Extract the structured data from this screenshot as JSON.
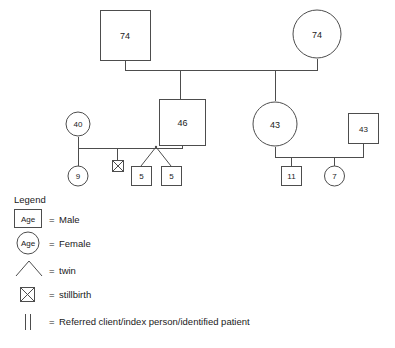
{
  "diagram": {
    "type": "genogram",
    "generations": [
      {
        "name": "grandparents",
        "members": [
          {
            "id": "g1-male",
            "shape": "square",
            "sex": "male",
            "age": "74"
          },
          {
            "id": "g1-female",
            "shape": "circle",
            "sex": "female",
            "age": "74"
          }
        ]
      },
      {
        "name": "parents",
        "members": [
          {
            "id": "g2-female-partner",
            "shape": "circle",
            "sex": "female",
            "age": "40"
          },
          {
            "id": "g2-son",
            "shape": "square",
            "sex": "male",
            "age": "46"
          },
          {
            "id": "g2-daughter",
            "shape": "circle",
            "sex": "female",
            "age": "43"
          },
          {
            "id": "g2-male-partner",
            "shape": "square",
            "sex": "male",
            "age": "43"
          }
        ]
      },
      {
        "name": "children",
        "members": [
          {
            "id": "g3-child-9",
            "shape": "circle",
            "sex": "female",
            "age": "9"
          },
          {
            "id": "g3-stillbirth",
            "shape": "stillbirth",
            "sex": "unknown",
            "age": ""
          },
          {
            "id": "g3-twin-a",
            "shape": "square",
            "sex": "male",
            "age": "5"
          },
          {
            "id": "g3-twin-b",
            "shape": "square",
            "sex": "male",
            "age": "5"
          },
          {
            "id": "g3-child-11",
            "shape": "square",
            "sex": "male",
            "age": "11"
          },
          {
            "id": "g3-child-7",
            "shape": "circle",
            "sex": "female",
            "age": "7"
          }
        ]
      }
    ]
  },
  "legend": {
    "title": "Legend",
    "items": [
      {
        "key_label": "Age",
        "key_shape": "square",
        "equals": "=",
        "description": "Male"
      },
      {
        "key_label": "Age",
        "key_shape": "circle",
        "equals": "=",
        "description": "Female"
      },
      {
        "key_label": "",
        "key_shape": "twin-chevron",
        "equals": "=",
        "description": "twin"
      },
      {
        "key_label": "",
        "key_shape": "crossed-square",
        "equals": "=",
        "description": "stillbirth"
      },
      {
        "key_label": "",
        "key_shape": "double-bar",
        "equals": "=",
        "description": "Referred client/index person/identified patient"
      }
    ]
  },
  "colors": {
    "stroke": "#4d4d4d",
    "text": "#1a1a1a",
    "background": "#ffffff"
  }
}
